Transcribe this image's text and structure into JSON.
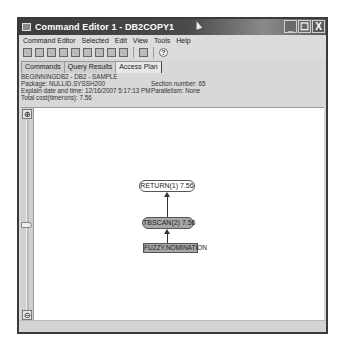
{
  "window": {
    "title": "Command Editor 1 - DB2COPY1",
    "controls": {
      "minimize": "_",
      "maximize": "☐",
      "close": "X"
    }
  },
  "menubar": {
    "items": [
      "Command Editor",
      "Selected",
      "Edit",
      "View",
      "Tools",
      "Help"
    ]
  },
  "toolbar": {
    "icons": [
      "connect-icon",
      "execute-icon",
      "execute-explain-icon",
      "open-icon",
      "save-icon",
      "sql-assist-icon",
      "copy-icon",
      "options-icon",
      "access-plan-icon",
      "layout-icon",
      "help-icon"
    ],
    "help_glyph": "?"
  },
  "tabs": [
    {
      "label": "Commands",
      "active": false
    },
    {
      "label": "Query Results",
      "active": false
    },
    {
      "label": "Access Plan",
      "active": true
    }
  ],
  "plan_info": {
    "line1": "BEGINNINGDB2 - DB2 - SAMPLE",
    "package": "Package: NULLID.SYSSH200",
    "explain_time": "Explain date and time: 12/16/2007 5:17:13 PM",
    "total_cost": "Total cost(timerons): 7.56",
    "section_number": "Section number: 65",
    "parallelism": "Parallelism: None"
  },
  "zoom": {
    "zoom_in_glyph": "🔍",
    "zoom_out_glyph": "🔍"
  },
  "graph": {
    "nodes": [
      {
        "id": "return",
        "label": "RETURN(1) 7.56",
        "shape": "rounded",
        "fill": "#ffffff"
      },
      {
        "id": "tbscan",
        "label": "TBSCAN(2) 7.56",
        "shape": "rounded",
        "fill": "#a8a8a8"
      },
      {
        "id": "table",
        "label": "FUZZY.NOMINATION",
        "shape": "rect",
        "fill": "#a8a8a8"
      }
    ]
  }
}
